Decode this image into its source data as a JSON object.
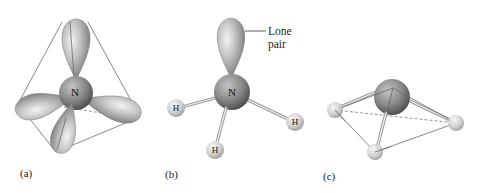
{
  "figure": {
    "panels": [
      {
        "id": "a",
        "label": "(a)",
        "central_atom": "N",
        "description": "sp3 hybrid orbitals in tetrahedral arrangement"
      },
      {
        "id": "b",
        "label": "(b)",
        "central_atom": "N",
        "substituents": [
          "H",
          "H",
          "H"
        ],
        "callout": {
          "line1": "Lone",
          "line2": "pair"
        }
      },
      {
        "id": "c",
        "label": "(c)",
        "description": "trigonal pyramidal molecular shape"
      }
    ],
    "colors": {
      "lobe_light": "#e4e4e4",
      "lobe_dark": "#6e6e6e",
      "central_atom_light": "#b4b4b4",
      "central_atom_dark": "#4a4a4a",
      "hydrogen_light": "#f0f0f0",
      "hydrogen_dark": "#9a9a9a",
      "edge": "#6a6a6a"
    }
  }
}
